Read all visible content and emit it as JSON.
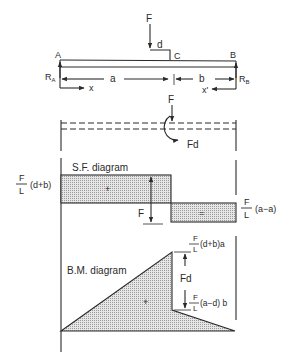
{
  "colors": {
    "ink": "#2a2a2a",
    "hatch": "#bdbdbd",
    "background": "#ffffff"
  },
  "beam": {
    "load_label": "F",
    "offset_label": "d",
    "point_a": "A",
    "point_b": "B",
    "point_c": "C",
    "reaction_a": "R",
    "reaction_a_sub": "A",
    "reaction_b": "R",
    "reaction_b_sub": "B",
    "dim_a": "a",
    "dim_b": "b",
    "coord_x": "x",
    "coord_x_prime": "x'"
  },
  "equivalent": {
    "force_label": "F",
    "moment_label": "Fd"
  },
  "sf_diagram": {
    "title": "S.F. diagram",
    "left_value_num": "F",
    "left_value_den": "L",
    "left_value_tail": "(d+b)",
    "right_value_num": "F",
    "right_value_den": "L",
    "right_value_tail": "(a−a)",
    "jump_label": "F",
    "positive_sign": "+",
    "negative_sign": "="
  },
  "bm_diagram": {
    "title": "B.M. diagram",
    "top_value_num": "F",
    "top_value_den": "L",
    "top_value_tail": "(d+b)a",
    "bottom_value_num": "F",
    "bottom_value_den": "L",
    "bottom_value_tail": "(a−d) b",
    "jump_label": "Fd",
    "positive_sign": "+"
  }
}
